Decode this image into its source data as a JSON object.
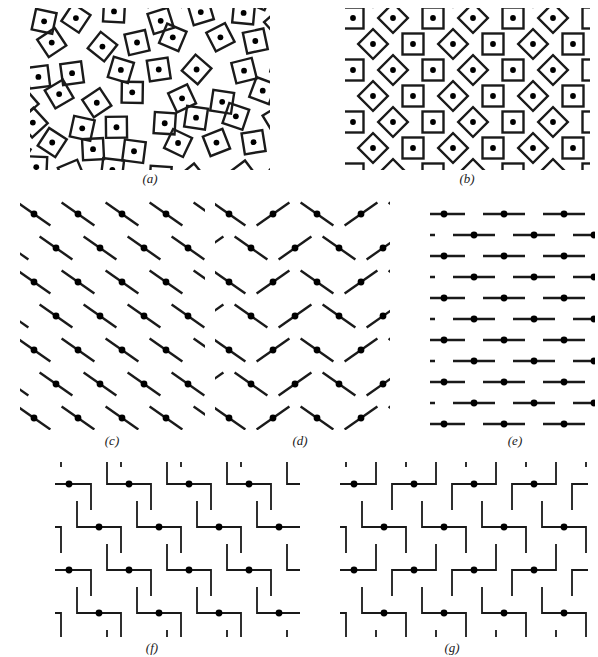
{
  "figure": {
    "background_color": "#ffffff",
    "ink_color": "#1a1a1a",
    "width": 598,
    "height": 657
  },
  "style": {
    "stroke_color": "#1a1a1a",
    "dot_color": "#000000",
    "stroke_width": 2.4,
    "thin_stroke_width": 1.8,
    "dot_radius": 3.4
  },
  "panels": [
    {
      "id": "a",
      "label": "(a)",
      "element_type": "square-with-center-dot",
      "arrangement": "random-orientation-jittered-lattice",
      "description": "Squares with a central dot, each randomly rotated, on a jittered lattice",
      "x": 30,
      "y": 8,
      "width": 240,
      "height": 162,
      "label_x": 150,
      "label_y": 172,
      "cols": 7,
      "rows": 7,
      "cell_w": 40,
      "cell_h": 26,
      "element_size": 21,
      "orientation_mode": "random",
      "jitter": 7
    },
    {
      "id": "b",
      "label": "(b)",
      "element_type": "square-with-center-dot",
      "arrangement": "regular-alternating-orientation-lattice",
      "description": "Squares with a central dot alternating between upright and 45-degree rotated on a regular lattice",
      "x": 345,
      "y": 8,
      "width": 245,
      "height": 162,
      "label_x": 467,
      "label_y": 172,
      "cols": 7,
      "rows": 7,
      "cell_w": 40,
      "cell_h": 26,
      "element_size": 21,
      "orientation_mode": "alternating",
      "jitter": 0
    },
    {
      "id": "c",
      "label": "(c)",
      "element_type": "line-segment-with-center-dot",
      "arrangement": "uniform-oblique-lattice",
      "description": "Oblique line segments all tilted the same way, dot at the centre",
      "x": 20,
      "y": 200,
      "width": 185,
      "height": 230,
      "label_x": 112,
      "label_y": 434,
      "cols": 5,
      "rows": 7,
      "cell_w": 44,
      "cell_h": 34,
      "element_length": 40,
      "angle_deg": 35,
      "orientation_mode": "uniform",
      "row_offset": 22
    },
    {
      "id": "d",
      "label": "(d)",
      "element_type": "line-segment-with-center-dot",
      "arrangement": "alternating-columns-herringbone",
      "description": "Oblique line segments whose tilt alternates by column, forming a herringbone texture",
      "x": 215,
      "y": 200,
      "width": 175,
      "height": 230,
      "label_x": 300,
      "label_y": 434,
      "cols": 5,
      "rows": 7,
      "cell_w": 44,
      "cell_h": 34,
      "element_length": 40,
      "angle_deg": 35,
      "orientation_mode": "alternating-columns",
      "row_offset": 22
    },
    {
      "id": "e",
      "label": "(e)",
      "element_type": "line-segment-with-center-dot",
      "arrangement": "horizontal-staggered-lattice",
      "description": "Horizontal line segments with a centre dot on a staggered (brick) lattice",
      "x": 430,
      "y": 200,
      "width": 165,
      "height": 230,
      "label_x": 515,
      "label_y": 434,
      "cols": 4,
      "rows": 11,
      "cell_w": 60,
      "cell_h": 21,
      "element_length": 42,
      "angle_deg": 0,
      "orientation_mode": "uniform",
      "row_offset": 30
    },
    {
      "id": "f",
      "label": "(f)",
      "element_type": "step-shape-with-dot",
      "arrangement": "uniform-step-staggered-lattice",
      "description": "Z-shaped step figures, all identical orientation, on a staggered lattice",
      "x": 55,
      "y": 462,
      "width": 245,
      "height": 175,
      "label_x": 152,
      "label_y": 641,
      "cols": 5,
      "rows": 4,
      "cell_w": 60,
      "cell_h": 43,
      "element_w": 44,
      "element_h": 26,
      "orientation_mode": "uniform",
      "row_offset": 30
    },
    {
      "id": "g",
      "label": "(g)",
      "element_type": "step-shape-with-dot",
      "arrangement": "alternating-rows-mirrored-steps",
      "description": "Step figures whose chirality mirrors on alternate rows (S and Z forms)",
      "x": 340,
      "y": 462,
      "width": 248,
      "height": 175,
      "label_x": 452,
      "label_y": 641,
      "cols": 5,
      "rows": 4,
      "cell_w": 60,
      "cell_h": 43,
      "element_w": 44,
      "element_h": 26,
      "orientation_mode": "alternating-rows",
      "row_offset": 30
    }
  ]
}
